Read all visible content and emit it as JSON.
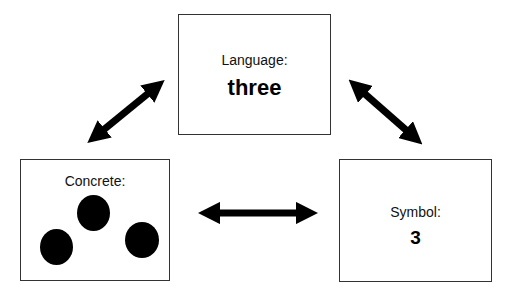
{
  "diagram": {
    "nodes": {
      "language": {
        "label": "Language:",
        "value": "three"
      },
      "concrete": {
        "label": "Concrete:",
        "value": "",
        "items": [
          "dot",
          "dot",
          "dot"
        ]
      },
      "symbol": {
        "label": "Symbol:",
        "value": "3"
      }
    },
    "edges": [
      {
        "from": "concrete",
        "to": "language",
        "type": "bidirectional-arrow"
      },
      {
        "from": "language",
        "to": "symbol",
        "type": "bidirectional-arrow"
      },
      {
        "from": "concrete",
        "to": "symbol",
        "type": "bidirectional-arrow"
      }
    ],
    "colors": {
      "arrow": "#000000",
      "border": "#333333",
      "background": "#ffffff"
    }
  }
}
